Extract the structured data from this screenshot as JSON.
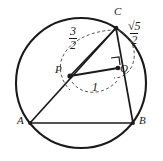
{
  "figure": {
    "stroke_color": "#1a1a1a",
    "dash_color": "#555555",
    "background": "#ffffff",
    "circle": {
      "cx": 81,
      "cy": 83,
      "r": 65
    },
    "points": [
      {
        "id": "A",
        "label": "A",
        "x": 30,
        "y": 123,
        "label_x": 17,
        "label_y": 118
      },
      {
        "id": "B",
        "label": "B",
        "x": 133,
        "y": 123,
        "label_x": 138,
        "label_y": 118
      },
      {
        "id": "C",
        "label": "C",
        "x": 116,
        "y": 28,
        "label_x": 116,
        "label_y": 10
      },
      {
        "id": "P",
        "label": "P",
        "x": 70,
        "y": 76,
        "label_x": 55,
        "label_y": 68
      },
      {
        "id": "Q",
        "label": "Q",
        "x": 118,
        "y": 68,
        "label_x": 120,
        "label_y": 68
      }
    ],
    "segments": [
      {
        "id": "AB",
        "from": "A",
        "to": "B"
      },
      {
        "id": "AC",
        "from": "A",
        "to": "C"
      },
      {
        "id": "CB",
        "from": "C",
        "to": "B"
      },
      {
        "id": "PC",
        "from": "P",
        "to": "C"
      },
      {
        "id": "PQ",
        "from": "P",
        "to": "Q"
      }
    ],
    "right_angle": {
      "at": "Q",
      "on_segments": [
        "PQ",
        "CB"
      ],
      "marker_x": 113,
      "marker_y": 60
    },
    "measurements": [
      {
        "id": "PC",
        "type": "fraction",
        "numerator": "3",
        "denominator": "2",
        "label_x": 70,
        "label_y": 26
      },
      {
        "id": "PQ",
        "type": "plain",
        "value": "1",
        "label_x": 92,
        "label_y": 85
      },
      {
        "id": "CQ",
        "type": "fraction",
        "numerator": "√5",
        "denominator": "2",
        "label_x": 128,
        "label_y": 22
      }
    ],
    "dashed_arcs": [
      {
        "id": "arc-PC",
        "describes": "3/2",
        "d": "M 116 30 C 96 30 72 38 63 56 C 58 66 60 80 70 90"
      },
      {
        "id": "arc-PQ",
        "describes": "1",
        "d": "M 72 82 C 82 96 104 96 118 80"
      },
      {
        "id": "arc-CQ",
        "describes": "sqrt5/2",
        "d": "M 118 30 C 132 36 138 52 132 66 C 128 74 122 78 114 78"
      }
    ]
  }
}
